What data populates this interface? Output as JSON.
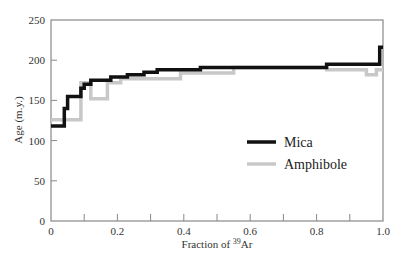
{
  "chart_data": {
    "type": "line",
    "subtype": "step",
    "title": "",
    "xlabel": "Fraction of 39Ar",
    "xlabel_parts": {
      "prefix": "Fraction of ",
      "sup": "39",
      "suffix": "Ar"
    },
    "ylabel": "Age (m.y.)",
    "xlim": [
      0,
      1.0
    ],
    "ylim": [
      0,
      250
    ],
    "xticks": [
      0,
      0.2,
      0.4,
      0.6,
      0.8,
      1.0
    ],
    "xtick_labels": [
      "0",
      "0.2",
      "0.4",
      "0.6",
      "0.8",
      "1.0"
    ],
    "xminor_ticks": [
      0.1,
      0.3,
      0.5,
      0.7,
      0.9
    ],
    "yticks": [
      0,
      50,
      100,
      150,
      200,
      250
    ],
    "ytick_labels": [
      "0",
      "50",
      "100",
      "150",
      "200",
      "250"
    ],
    "grid": false,
    "legend_position": "center-right",
    "series": [
      {
        "name": "Mica",
        "color": "#111111",
        "line_width": 3.5,
        "steps": [
          {
            "x0": 0.0,
            "x1": 0.04,
            "y": 118
          },
          {
            "x0": 0.04,
            "x1": 0.05,
            "y": 140
          },
          {
            "x0": 0.05,
            "x1": 0.09,
            "y": 155
          },
          {
            "x0": 0.09,
            "x1": 0.1,
            "y": 165
          },
          {
            "x0": 0.1,
            "x1": 0.12,
            "y": 170
          },
          {
            "x0": 0.12,
            "x1": 0.18,
            "y": 175
          },
          {
            "x0": 0.18,
            "x1": 0.23,
            "y": 179
          },
          {
            "x0": 0.23,
            "x1": 0.28,
            "y": 182
          },
          {
            "x0": 0.28,
            "x1": 0.32,
            "y": 185
          },
          {
            "x0": 0.32,
            "x1": 0.45,
            "y": 188
          },
          {
            "x0": 0.45,
            "x1": 0.83,
            "y": 191
          },
          {
            "x0": 0.83,
            "x1": 0.99,
            "y": 195
          },
          {
            "x0": 0.99,
            "x1": 1.0,
            "y": 216
          }
        ]
      },
      {
        "name": "Amphibole",
        "color": "#c8c8c8",
        "line_width": 3.5,
        "steps": [
          {
            "x0": 0.0,
            "x1": 0.09,
            "y": 126
          },
          {
            "x0": 0.09,
            "x1": 0.12,
            "y": 172
          },
          {
            "x0": 0.12,
            "x1": 0.17,
            "y": 152
          },
          {
            "x0": 0.17,
            "x1": 0.21,
            "y": 172
          },
          {
            "x0": 0.21,
            "x1": 0.39,
            "y": 177
          },
          {
            "x0": 0.39,
            "x1": 0.55,
            "y": 184
          },
          {
            "x0": 0.55,
            "x1": 0.83,
            "y": 191
          },
          {
            "x0": 0.83,
            "x1": 0.95,
            "y": 188
          },
          {
            "x0": 0.95,
            "x1": 0.98,
            "y": 182
          },
          {
            "x0": 0.98,
            "x1": 1.0,
            "y": 188
          }
        ]
      }
    ]
  },
  "legend": {
    "items": [
      {
        "label": "Mica",
        "color": "#111111"
      },
      {
        "label": "Amphibole",
        "color": "#c8c8c8"
      }
    ]
  },
  "axes": {
    "x_label_prefix": "Fraction of ",
    "x_label_sup": "39",
    "x_label_suffix": "Ar",
    "y_label": "Age (m.y.)"
  }
}
